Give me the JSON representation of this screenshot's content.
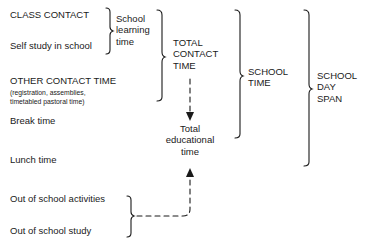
{
  "left_items": {
    "class_contact": "CLASS CONTACT",
    "self_study": "Self study in school",
    "other_contact": "OTHER CONTACT TIME",
    "other_contact_note_1": "(registration, assemblies,",
    "other_contact_note_2": "timetabled pastoral time)",
    "break_time": "Break time",
    "lunch_time": "Lunch time",
    "out_activities": "Out of school activities",
    "out_study": "Out of school study"
  },
  "groups": {
    "school_learning": [
      "School",
      "learning",
      "time"
    ],
    "total_contact": [
      "TOTAL",
      "CONTACT",
      "TIME"
    ],
    "school_time": [
      "SCHOOL",
      "TIME"
    ],
    "school_day_span": [
      "SCHOOL",
      "DAY",
      "SPAN"
    ],
    "total_educational": [
      "Total",
      "educational",
      "time"
    ]
  },
  "colors": {
    "ink": "#1a1a1a",
    "background": "#ffffff"
  }
}
